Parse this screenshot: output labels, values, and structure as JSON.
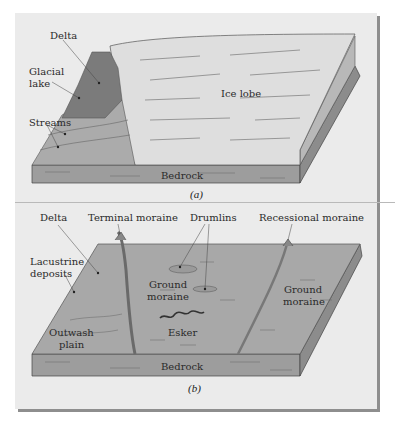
{
  "figure": {
    "panel_a": {
      "caption": "(a)",
      "labels": {
        "delta": "Delta",
        "glacial_lake": "Glacial lake",
        "glacial_lake_line1": "Glacial",
        "glacial_lake_line2": "lake",
        "streams": "Streams",
        "ice_lobe": "Ice lobe",
        "bedrock": "Bedrock"
      }
    },
    "panel_b": {
      "caption": "(b)",
      "labels": {
        "delta": "Delta",
        "terminal_moraine": "Terminal moraine",
        "drumlins": "Drumlins",
        "recessional_moraine": "Recessional moraine",
        "lacustrine_line1": "Lacustrine",
        "lacustrine_line2": "deposits",
        "ground_moraine_1_line1": "Ground",
        "ground_moraine_1_line2": "moraine",
        "ground_moraine_2_line1": "Ground",
        "ground_moraine_2_line2": "moraine",
        "outwash_line1": "Outwash",
        "outwash_line2": "plain",
        "esker": "Esker",
        "bedrock": "Bedrock"
      }
    },
    "colors": {
      "panel_bg": "#ebebeb",
      "shadow": "#8e8e8e",
      "lake": "#7a7a7a",
      "outwash": "#a9a9a9",
      "ice": "#dcdcdc",
      "ground": "#a6a6a6",
      "bedrock_front": "#9a9a9a",
      "bedrock_side": "#8a8a8a"
    }
  }
}
